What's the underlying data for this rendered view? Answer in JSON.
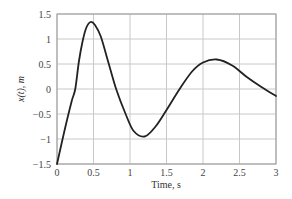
{
  "chart_data": {
    "type": "line",
    "title": "",
    "xlabel": "Time, s",
    "ylabel": "x(t), m",
    "xlim": [
      0,
      3
    ],
    "ylim": [
      -1.5,
      1.5
    ],
    "grid": true,
    "legend": null,
    "x_ticks": [
      "0",
      "0.5",
      "1",
      "1.5",
      "2",
      "2.5",
      "3"
    ],
    "y_ticks": [
      "1.5",
      "1",
      "0.5",
      "0",
      "-0.5",
      "-1",
      "-1.5"
    ],
    "series": [
      {
        "name": "x(t)",
        "color": "#222222",
        "x": [
          0,
          0.1,
          0.2,
          0.25,
          0.3,
          0.35,
          0.4,
          0.46,
          0.52,
          0.6,
          0.7,
          0.81,
          0.94,
          1.05,
          1.2,
          1.35,
          1.5,
          1.68,
          1.85,
          2.0,
          2.19,
          2.4,
          2.6,
          2.8,
          3.0
        ],
        "y": [
          -1.5,
          -0.85,
          -0.25,
          0.0,
          0.55,
          0.95,
          1.22,
          1.34,
          1.28,
          1.05,
          0.55,
          0.0,
          -0.5,
          -0.84,
          -0.95,
          -0.75,
          -0.42,
          0.0,
          0.35,
          0.53,
          0.59,
          0.47,
          0.24,
          0.04,
          -0.14
        ]
      }
    ]
  }
}
